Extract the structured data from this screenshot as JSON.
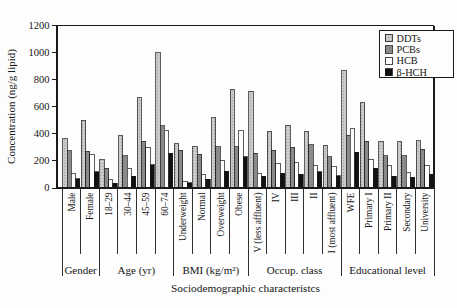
{
  "figure_title": "",
  "colors": {
    "axis": "#1a1a1a",
    "ddts_fill": "#cacaca",
    "ddts_dot": "#9e9e9e",
    "pcbs_fill": "#8a8a8a",
    "hcb_fill": "#ffffff",
    "bhch_fill": "#111111",
    "legend_bg": "#fdfdfd"
  },
  "chart_data": {
    "type": "bar",
    "title": "",
    "xlabel": "Sociodemographic characteristcs",
    "ylabel": "Concentration (ng/g lipid)",
    "ylim": [
      0,
      1200
    ],
    "y_ticks": [
      0,
      200,
      400,
      600,
      800,
      1000,
      1200
    ],
    "grid": false,
    "legend_position": "upper right",
    "groups": [
      {
        "label": "Gender",
        "count": 2
      },
      {
        "label": "Age (yr)",
        "count": 4
      },
      {
        "label": "BMI (kg/m²)",
        "count": 4
      },
      {
        "label": "Occup. class",
        "count": 5
      },
      {
        "label": "Educational level",
        "count": 5
      }
    ],
    "categories": [
      "Male",
      "Female",
      "18–29",
      "30–44",
      "45–59",
      "60–74",
      "Underweight",
      "Normal",
      "Overweight",
      "Obese",
      "V (less affluent)",
      "IV",
      "III",
      "II",
      "I (most affluent)",
      "WFE",
      "Primary I",
      "Primary II",
      "Secondary",
      "University"
    ],
    "series": [
      {
        "name": "DDTs",
        "pattern": "dots",
        "color": "#cacaca",
        "values": [
          365,
          500,
          210,
          385,
          665,
          1000,
          325,
          305,
          520,
          730,
          715,
          420,
          465,
          420,
          315,
          865,
          630,
          340,
          340,
          350
        ]
      },
      {
        "name": "PCBs",
        "pattern": "none",
        "color": "#8a8a8a",
        "values": [
          275,
          270,
          145,
          240,
          345,
          460,
          280,
          250,
          305,
          305,
          255,
          280,
          300,
          320,
          230,
          390,
          345,
          240,
          240,
          285
        ]
      },
      {
        "name": "HCB",
        "pattern": "none",
        "color": "#ffffff",
        "values": [
          105,
          250,
          65,
          145,
          300,
          425,
          50,
          100,
          200,
          425,
          110,
          180,
          185,
          165,
          160,
          440,
          210,
          165,
          115,
          165
        ]
      },
      {
        "name": "β-HCH",
        "pattern": "none",
        "color": "#111111",
        "values": [
          70,
          120,
          35,
          85,
          170,
          255,
          40,
          65,
          125,
          230,
          85,
          110,
          100,
          120,
          90,
          265,
          145,
          85,
          80,
          100
        ]
      }
    ]
  }
}
